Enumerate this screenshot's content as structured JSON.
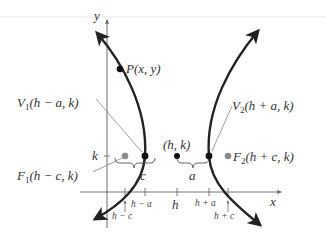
{
  "diagram": {
    "type": "hyperbola-horizontal-transverse-axis",
    "axes": {
      "x_label": "x",
      "y_label": "y"
    },
    "points": {
      "P": {
        "label": "P(x, y)"
      },
      "V1": {
        "label_main": "V",
        "label_sub": "1",
        "label_rest": "(h − a, k)"
      },
      "V2": {
        "label_main": "V",
        "label_sub": "2",
        "label_rest": "(h + a, k)"
      },
      "F1": {
        "label_main": "F",
        "label_sub": "1",
        "label_rest": "(h − c, k)"
      },
      "F2": {
        "label_main": "F",
        "label_sub": "2",
        "label_rest": "(h + c, k)"
      },
      "center": {
        "label": "(h, k)"
      }
    },
    "braces": {
      "left": "c",
      "right": "a"
    },
    "y_tick": "k",
    "x_ticks": {
      "h_minus_c": "h − c",
      "h_minus_a": "h − a",
      "h": "h",
      "h_plus_a": "h + a",
      "h_plus_c": "h + c"
    },
    "colors": {
      "curve": "#222222",
      "axis": "#777777",
      "focus": "#8c8c8c",
      "vertex": "#111111",
      "leader": "#888888"
    }
  }
}
